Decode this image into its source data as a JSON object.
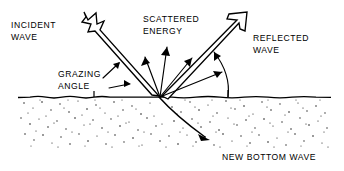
{
  "diagram": {
    "background_color": "#ffffff",
    "ink_color": "#000000",
    "width": 344,
    "height": 171,
    "labels": {
      "incident_wave_line1": "INCIDENT",
      "incident_wave_line2": "WAVE",
      "grazing_angle_line1": "GRAZING",
      "grazing_angle_line2": "ANGLE",
      "scattered_energy_line1": "SCATTERED",
      "scattered_energy_line2": "ENERGY",
      "reflected_wave_line1": "REFLECTED",
      "reflected_wave_line2": "WAVE",
      "new_bottom_wave": "NEW BOTTOM WAVE"
    },
    "elements": {
      "incident_wave_arrow_name": "incident-wave-arrow",
      "reflected_wave_arrow_name": "reflected-wave-arrow",
      "scattered_rays_count": 4,
      "grazing_angle_pointers_count": 2,
      "bottom_wave_arrow_name": "new-bottom-wave-arrow",
      "seabed_name": "seabed-sediment",
      "water_bottom_interface_name": "water-bottom-interface"
    },
    "geometry": {
      "scatter_point_x": 160,
      "scatter_point_y": 97,
      "interface_y": 97,
      "interface_x_start": 18,
      "interface_x_end": 331,
      "seabed_bottom_y": 148
    }
  }
}
